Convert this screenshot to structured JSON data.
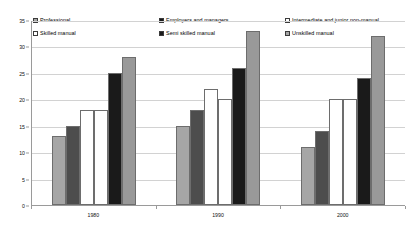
{
  "chart_data": {
    "type": "bar",
    "title": "",
    "subtitle": "",
    "xlabel": "",
    "ylabel": "",
    "categories": [
      "1980",
      "1990",
      "2000"
    ],
    "ylim": [
      0,
      35
    ],
    "yticks": [
      0,
      5,
      10,
      15,
      20,
      25,
      30,
      35
    ],
    "ytick_labels": [
      "0",
      "5",
      "10",
      "15",
      "20",
      "25",
      "30",
      "35"
    ],
    "grid": true,
    "legend_position": "top",
    "series": [
      {
        "name": "Professional",
        "color": "#a6a6a6",
        "swatch": "#a6a6a6",
        "values": [
          13,
          15,
          11
        ]
      },
      {
        "name": "Employers and managers",
        "color": "#4d4d4d",
        "swatch": "#1a1a1a",
        "values": [
          15,
          18,
          14
        ]
      },
      {
        "name": "Intermediate and junior non-manual",
        "color": "#ffffff",
        "swatch": "#ffffff",
        "values": [
          18,
          22,
          20
        ]
      },
      {
        "name": "Skilled manual",
        "color": "#ffffff",
        "swatch": "#ffffff",
        "values": [
          18,
          20,
          20
        ]
      },
      {
        "name": "Semi skilled manual",
        "color": "#1a1a1a",
        "swatch": "#1a1a1a",
        "values": [
          25,
          26,
          24
        ]
      },
      {
        "name": "Unskilled manual",
        "color": "#999999",
        "swatch": "#a6a6a6",
        "values": [
          28,
          33,
          32
        ]
      }
    ]
  },
  "legend": {
    "items": [
      {
        "label": "Professional",
        "swatch": "#a6a6a6",
        "name": "legend-professional"
      },
      {
        "label": "Skilled manual",
        "swatch": "#ffffff",
        "name": "legend-skilled-manual"
      },
      {
        "label": "Employers and managers",
        "swatch": "#1a1a1a",
        "name": "legend-employers-and-managers"
      },
      {
        "label": "Semi skilled manual",
        "swatch": "#1a1a1a",
        "name": "legend-semi-skilled-manual"
      },
      {
        "label": "Intermediate and junior non-manual",
        "swatch": "#ffffff",
        "name": "legend-intermediate-and-junior-non-manual"
      },
      {
        "label": "Unskilled manual",
        "swatch": "#a6a6a6",
        "name": "legend-unskilled-manual"
      }
    ]
  }
}
